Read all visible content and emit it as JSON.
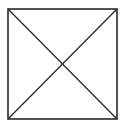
{
  "diagram": {
    "type": "square-with-diagonals",
    "background": "#ffffff",
    "stroke_color": "#2a2a2a",
    "square": {
      "x1": 8,
      "y1": 9,
      "x2": 117,
      "y2": 119
    },
    "diagonals": [
      {
        "from": [
          8,
          9
        ],
        "to": [
          117,
          119
        ]
      },
      {
        "from": [
          117,
          9
        ],
        "to": [
          8,
          119
        ]
      }
    ]
  }
}
